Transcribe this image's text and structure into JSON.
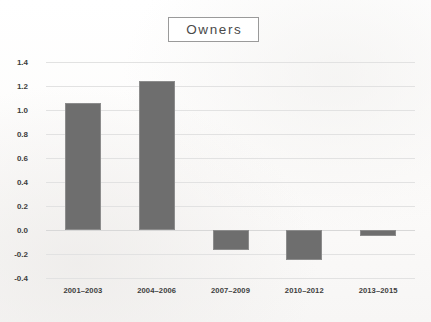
{
  "title": {
    "text": "Owners"
  },
  "chart_data": {
    "type": "bar",
    "title": "Owners",
    "xlabel": "",
    "ylabel": "",
    "categories": [
      "2001–2003",
      "2004–2006",
      "2007–2009",
      "2010–2012",
      "2013–2015"
    ],
    "values": [
      1.06,
      1.24,
      -0.17,
      -0.25,
      -0.05
    ],
    "ylim": [
      -0.4,
      1.4
    ],
    "yticks": [
      1.4,
      1.2,
      1.0,
      0.8,
      0.6,
      0.4,
      0.2,
      0.0,
      -0.2,
      -0.4
    ],
    "ytick_labels": [
      "1.4",
      "1.2",
      "1.0",
      "0.8",
      "0.6",
      "0.4",
      "0.2",
      "0.0",
      "-0.2",
      "-0.4"
    ],
    "grid": true,
    "legend": false,
    "bar_color": "#6e6e6e",
    "gridline_color": "#e2e2e2",
    "background_color": "#fdfdfd",
    "text_color": "#3d3d3d"
  }
}
